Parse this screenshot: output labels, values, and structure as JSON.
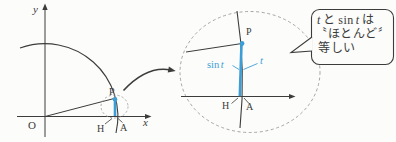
{
  "figure": {
    "bg": "#fcfcfa",
    "line_color": "#3c3c3c",
    "accent_blue": "#3d9ed6",
    "dash_color": "#a3a3a3"
  },
  "left_diagram": {
    "y_axis_label": "y",
    "x_axis_label": "x",
    "origin_label": "O",
    "point_p": "P",
    "point_h": "H",
    "point_a": "A"
  },
  "zoom_view": {
    "point_p": "P",
    "point_h": "H",
    "point_a": "A",
    "sin_label": "sin",
    "sin_var": "t",
    "arc_var": "t"
  },
  "callout": {
    "l1_var1": "t",
    "l1_mid": "と",
    "l1_sin": "sin",
    "l1_var2": "t",
    "l1_end": "は",
    "l2": "〝ほとんど〞",
    "l3": "等しい"
  }
}
